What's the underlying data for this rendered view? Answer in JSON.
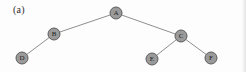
{
  "figure": {
    "caption": "(a)",
    "width": 246,
    "height": 72,
    "background_color": "#fdfdfd",
    "node_fill_color": "#9a9a9a",
    "node_stroke_color": "#5d5d5d",
    "edge_color": "#8f8f8f",
    "label_color": "#1c1c1c"
  },
  "chart_data": {
    "type": "diagram",
    "diagram_kind": "tree-graph",
    "title": "(a)",
    "nodes": [
      {
        "id": "A",
        "label": "A",
        "x": 116,
        "y": 13,
        "r": 6
      },
      {
        "id": "B",
        "label": "B",
        "x": 54,
        "y": 34,
        "r": 6
      },
      {
        "id": "C",
        "label": "C",
        "x": 181,
        "y": 36,
        "r": 6
      },
      {
        "id": "D",
        "label": "D",
        "x": 22,
        "y": 58,
        "r": 6
      },
      {
        "id": "E",
        "label": "E",
        "x": 152,
        "y": 59,
        "r": 6
      },
      {
        "id": "F",
        "label": "F",
        "x": 211,
        "y": 58,
        "r": 6
      }
    ],
    "edges": [
      {
        "from": "A",
        "to": "B"
      },
      {
        "from": "A",
        "to": "C"
      },
      {
        "from": "B",
        "to": "D"
      },
      {
        "from": "C",
        "to": "E"
      },
      {
        "from": "C",
        "to": "F"
      }
    ],
    "root": "A",
    "directed": false
  }
}
